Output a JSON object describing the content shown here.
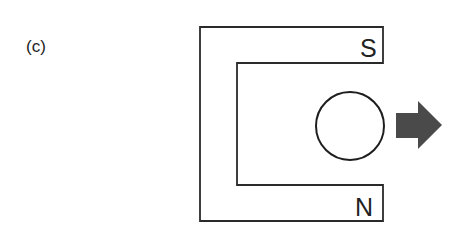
{
  "figure": {
    "panel_label": "(c)",
    "magnet": {
      "type": "horseshoe",
      "top_pole_label": "S",
      "bottom_pole_label": "N"
    },
    "conductor": {
      "shape": "circle"
    },
    "motion_arrow": {
      "direction": "right",
      "color": "#4a4a4a"
    }
  }
}
